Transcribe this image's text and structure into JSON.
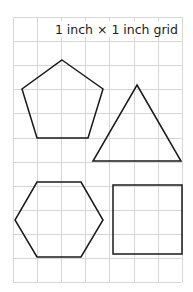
{
  "caption": "1 inch × 1 inch grid",
  "grid": {
    "x0": 13,
    "y0": 17,
    "cell": 24.1,
    "cols": 7,
    "rows": 11,
    "line_color": "#d6d6d6"
  },
  "shapes": [
    {
      "name": "pentagon",
      "points": "62,60 103,89 88,138 37,138 22,89"
    },
    {
      "name": "triangle",
      "points": "137,85 181,161 93,161"
    },
    {
      "name": "hexagon",
      "points": "37,182 81,182 103,220 81,257 37,257 15,220"
    },
    {
      "name": "square",
      "points": "113,185 182,185 182,254 113,254"
    }
  ],
  "colors": {
    "stroke": "#1a1a1a",
    "background": "#ffffff"
  }
}
